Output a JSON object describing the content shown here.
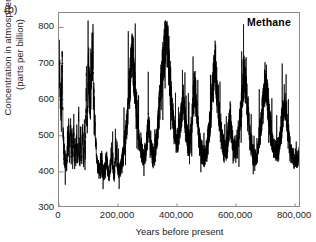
{
  "figure": {
    "panel_letter": "(b)",
    "series_title": "Methane"
  },
  "chart_data": {
    "type": "line",
    "title": "Methane",
    "xlabel": "Years before present",
    "ylabel_line1": "Concentration in atmosphere",
    "ylabel_line2": "(parts per billion)",
    "xlim": [
      0,
      820000
    ],
    "ylim": [
      300,
      840
    ],
    "grid": false,
    "legend": "none",
    "xticks": [
      0,
      200000,
      400000,
      600000,
      800000
    ],
    "xticklabels": [
      "0",
      "200,000",
      "400,000",
      "600,000",
      "800,000"
    ],
    "yticks": [
      300,
      400,
      500,
      600,
      700,
      800
    ],
    "yticklabels": [
      "300",
      "400",
      "500",
      "600",
      "700",
      "800"
    ],
    "line_color": "#000000",
    "line_width": 0.7,
    "series_name": "Methane concentration",
    "x_units": "years before present",
    "y_units": "parts per billion",
    "x": [
      0,
      1000,
      2000,
      3000,
      4000,
      5000,
      6000,
      7000,
      8000,
      9000,
      10000,
      11000,
      12000,
      13000,
      14000,
      15000,
      16000,
      17000,
      18000,
      19000,
      20000,
      21000,
      22000,
      23000,
      24000,
      25000,
      26000,
      27000,
      28000,
      29000,
      30000,
      31000,
      32000,
      33000,
      34000,
      35000,
      36000,
      37000,
      38000,
      39000,
      40000,
      41000,
      42000,
      43000,
      44000,
      45000,
      46000,
      47000,
      48000,
      49000,
      50000,
      51000,
      52000,
      53000,
      54000,
      55000,
      56000,
      57000,
      58000,
      59000,
      60000,
      61000,
      62000,
      63000,
      64000,
      65000,
      66000,
      67000,
      68000,
      69000,
      70000,
      71000,
      72000,
      73000,
      74000,
      75000,
      76000,
      77000,
      78000,
      79000,
      80000,
      81000,
      82000,
      83000,
      84000,
      85000,
      86000,
      87000,
      88000,
      89000,
      90000,
      91000,
      92000,
      93000,
      94000,
      95000,
      96000,
      97000,
      98000,
      99000,
      100000,
      102000,
      104000,
      106000,
      108000,
      110000,
      112000,
      114000,
      116000,
      118000,
      120000,
      122000,
      124000,
      126000,
      128000,
      130000,
      132000,
      134000,
      136000,
      138000,
      140000,
      142000,
      144000,
      146000,
      148000,
      150000,
      152000,
      154000,
      156000,
      158000,
      160000,
      162000,
      164000,
      166000,
      168000,
      170000,
      172000,
      174000,
      176000,
      178000,
      180000,
      182000,
      184000,
      186000,
      188000,
      190000,
      192000,
      194000,
      196000,
      198000,
      200000,
      204000,
      208000,
      212000,
      216000,
      220000,
      224000,
      228000,
      232000,
      236000,
      240000,
      244000,
      248000,
      252000,
      256000,
      260000,
      264000,
      268000,
      272000,
      276000,
      280000,
      284000,
      288000,
      292000,
      296000,
      300000,
      304000,
      308000,
      312000,
      316000,
      320000,
      324000,
      328000,
      332000,
      336000,
      340000,
      344000,
      348000,
      352000,
      356000,
      360000,
      364000,
      368000,
      372000,
      376000,
      380000,
      384000,
      388000,
      392000,
      396000,
      400000,
      404000,
      408000,
      412000,
      416000,
      420000,
      424000,
      428000,
      432000,
      436000,
      440000,
      444000,
      448000,
      452000,
      456000,
      460000,
      464000,
      468000,
      472000,
      476000,
      480000,
      484000,
      488000,
      492000,
      496000,
      500000,
      504000,
      508000,
      512000,
      516000,
      520000,
      524000,
      528000,
      532000,
      536000,
      540000,
      544000,
      548000,
      552000,
      556000,
      560000,
      564000,
      568000,
      572000,
      576000,
      580000,
      584000,
      588000,
      592000,
      596000,
      600000,
      604000,
      608000,
      612000,
      616000,
      620000,
      624000,
      628000,
      632000,
      636000,
      640000,
      644000,
      648000,
      652000,
      656000,
      660000,
      664000,
      668000,
      672000,
      676000,
      680000,
      684000,
      688000,
      692000,
      696000,
      700000,
      704000,
      708000,
      712000,
      716000,
      720000,
      724000,
      728000,
      732000,
      736000,
      740000,
      744000,
      748000,
      752000,
      756000,
      760000,
      764000,
      768000,
      772000,
      776000,
      780000,
      784000,
      788000,
      792000,
      796000,
      800000,
      804000,
      808000,
      812000
    ],
    "y": [
      690,
      700,
      715,
      660,
      620,
      600,
      590,
      580,
      600,
      640,
      680,
      700,
      640,
      560,
      520,
      490,
      470,
      455,
      445,
      440,
      435,
      430,
      425,
      420,
      418,
      415,
      420,
      440,
      470,
      500,
      470,
      440,
      480,
      520,
      490,
      460,
      440,
      470,
      510,
      545,
      500,
      465,
      440,
      460,
      500,
      470,
      445,
      430,
      455,
      490,
      520,
      480,
      450,
      435,
      455,
      485,
      450,
      430,
      440,
      470,
      510,
      470,
      445,
      430,
      450,
      480,
      520,
      560,
      500,
      460,
      440,
      455,
      480,
      510,
      470,
      445,
      430,
      440,
      465,
      500,
      540,
      490,
      455,
      435,
      450,
      480,
      520,
      480,
      450,
      470,
      510,
      560,
      610,
      650,
      600,
      550,
      520,
      560,
      600,
      650,
      700,
      660,
      620,
      580,
      620,
      680,
      720,
      680,
      640,
      600,
      560,
      520,
      480,
      450,
      430,
      420,
      415,
      410,
      408,
      405,
      410,
      420,
      440,
      420,
      405,
      400,
      398,
      396,
      400,
      410,
      430,
      450,
      420,
      405,
      398,
      395,
      400,
      415,
      435,
      460,
      430,
      410,
      400,
      398,
      402,
      420,
      445,
      470,
      440,
      415,
      405,
      400,
      405,
      420,
      440,
      465,
      490,
      520,
      560,
      600,
      650,
      700,
      740,
      700,
      650,
      600,
      560,
      520,
      490,
      470,
      455,
      445,
      440,
      450,
      470,
      500,
      530,
      500,
      470,
      450,
      440,
      450,
      470,
      500,
      540,
      580,
      620,
      660,
      700,
      740,
      780,
      800,
      760,
      710,
      660,
      610,
      570,
      540,
      510,
      490,
      480,
      490,
      510,
      540,
      570,
      600,
      570,
      540,
      510,
      490,
      480,
      490,
      520,
      560,
      600,
      640,
      600,
      560,
      520,
      490,
      470,
      455,
      445,
      440,
      445,
      460,
      480,
      510,
      540,
      580,
      620,
      660,
      700,
      660,
      620,
      580,
      540,
      510,
      490,
      475,
      465,
      460,
      470,
      490,
      520,
      550,
      520,
      490,
      470,
      460,
      465,
      480,
      500,
      530,
      560,
      600,
      640,
      680,
      640,
      600,
      560,
      520,
      490,
      470,
      455,
      445,
      440,
      445,
      460,
      480,
      505,
      530,
      560,
      590,
      620,
      650,
      620,
      590,
      560,
      530,
      500,
      480,
      465,
      455,
      450,
      455,
      470,
      490,
      515,
      540,
      570,
      600,
      570,
      540,
      510,
      485,
      465,
      450,
      440,
      435,
      430,
      428,
      430,
      440,
      455,
      475,
      500,
      530,
      560,
      590,
      620,
      650,
      680,
      650,
      620,
      590,
      560,
      530,
      505,
      485,
      470,
      460,
      455,
      460,
      475,
      495,
      520,
      550,
      580,
      610,
      640,
      670,
      700,
      660,
      620,
      580,
      545,
      515,
      490,
      470,
      460,
      455,
      460,
      475,
      495,
      520,
      550,
      585,
      620,
      660,
      700,
      740,
      700,
      660,
      620,
      585,
      555,
      530,
      510,
      495,
      485,
      480,
      485
    ]
  }
}
